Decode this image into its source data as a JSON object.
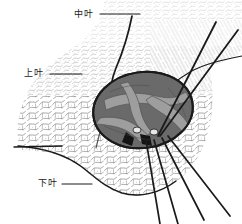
{
  "figure": {
    "background_color": "#ffffff",
    "ink_color": "#1a1a1a",
    "hilum_fill_color": "#6a6a6a",
    "hilum_highlight_color": "#9e9e9e",
    "tissue_color": "#3a3a3a"
  },
  "labels": {
    "middle_lobe": "中叶",
    "upper_lobe": "上叶",
    "lower_lobe": "下叶"
  },
  "leader_lines": [
    {
      "name": "middle-lobe-leader",
      "x1": 100,
      "y1": 14,
      "x2": 140,
      "y2": 14
    },
    {
      "name": "upper-lobe-leader",
      "x1": 50,
      "y1": 74,
      "x2": 82,
      "y2": 74
    },
    {
      "name": "lower-lobe-leader",
      "x1": 62,
      "y1": 184,
      "x2": 92,
      "y2": 184
    }
  ],
  "sutures": {
    "upper_right_count": 2,
    "lower_right_count": 4
  }
}
